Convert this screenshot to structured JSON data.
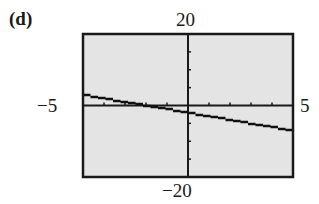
{
  "panel_label": "(d)",
  "window": {
    "xmin_label": "−5",
    "xmax_label": "5",
    "ymin_label": "−20",
    "ymax_label": "20"
  },
  "colors": {
    "screen_bg": "#e4e4e4",
    "frame": "#1a1a1a",
    "line": "#111111"
  },
  "chart_data": {
    "type": "line",
    "title": "(d)",
    "xlabel": "",
    "ylabel": "",
    "xlim": [
      -5,
      5
    ],
    "ylim": [
      -20,
      20
    ],
    "x_ticks_step": 1,
    "y_ticks_step": 5,
    "tick_labels": {
      "x": [
        "-5",
        "5"
      ],
      "y": [
        "-20",
        "20"
      ]
    },
    "grid": false,
    "legend": null,
    "series": [
      {
        "name": "y = -x - 2",
        "x": [
          -5,
          -4,
          -3,
          -2,
          -1,
          0,
          1,
          2,
          3,
          4,
          5
        ],
        "values": [
          3,
          2,
          1,
          0,
          -1,
          -2,
          -3,
          -4,
          -5,
          -6,
          -7
        ]
      }
    ]
  }
}
